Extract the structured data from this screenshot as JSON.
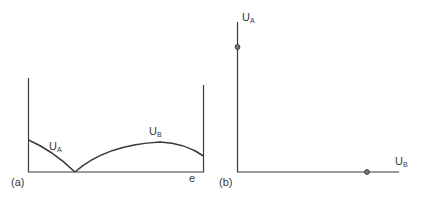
{
  "panel_a": {
    "tag": "(a)",
    "x_axis_label": "e",
    "curve_a": {
      "label": "U",
      "sub": "A"
    },
    "curve_b": {
      "label": "U",
      "sub": "B"
    }
  },
  "panel_b": {
    "tag": "(b)",
    "y_axis": {
      "label": "U",
      "sub": "A"
    },
    "x_axis": {
      "label": "U",
      "sub": "B"
    },
    "points": [
      {
        "name": "point-on-UA-axis",
        "x": 237,
        "y": 47
      },
      {
        "name": "point-on-UB-axis",
        "x": 367,
        "y": 172
      }
    ]
  },
  "colors": {
    "line": "#3a3a3a",
    "background": "#ffffff",
    "dot_fill": "#7a7a7a"
  }
}
